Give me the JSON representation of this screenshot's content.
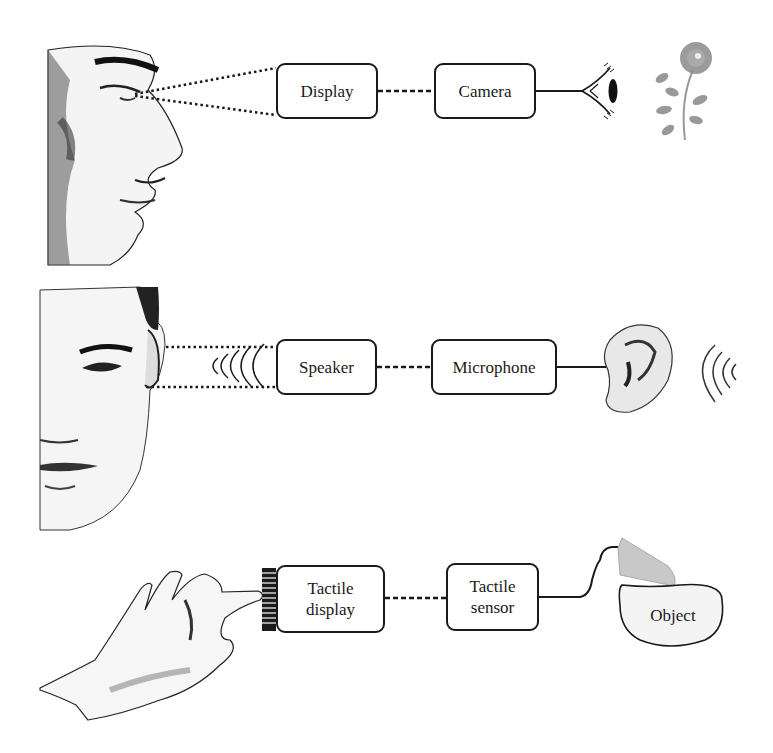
{
  "figure": {
    "rows": [
      {
        "id": "vision",
        "sense_organ": "eye",
        "illustration_left": "human-profile-face",
        "display_box": {
          "label": "Display"
        },
        "sensor_box": {
          "label": "Camera"
        },
        "sensor_icon": "eye-icon",
        "target": "flower"
      },
      {
        "id": "hearing",
        "sense_organ": "ear",
        "illustration_left": "human-front-face",
        "display_box": {
          "label": "Speaker"
        },
        "sensor_box": {
          "label": "Microphone"
        },
        "sensor_icon": "ear-icon",
        "target": "sound-waves"
      },
      {
        "id": "touch",
        "sense_organ": "hand",
        "illustration_left": "human-hand",
        "display_box": {
          "label_line1": "Tactile",
          "label_line2": "display"
        },
        "sensor_box": {
          "label_line1": "Tactile",
          "label_line2": "sensor"
        },
        "sensor_icon": "fingertip-sensor-icon",
        "target": {
          "label": "Object"
        }
      }
    ],
    "colors": {
      "ink": "#1a1a1a",
      "skin_shade": "#888888",
      "flower": "#8a8a8a",
      "object_fill": "#f2f2f2"
    }
  }
}
